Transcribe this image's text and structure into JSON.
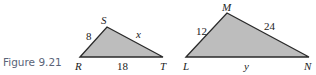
{
  "caption": "Figure 9.21",
  "colors": {
    "fill": "#bdbdbd",
    "stroke": "#2a2a2a",
    "caption": "#5a6478"
  },
  "triangle1": {
    "vertices": {
      "R": "R",
      "S": "S",
      "T": "T"
    },
    "sides": {
      "RS": "8",
      "ST": "x",
      "RT": "18"
    }
  },
  "triangle2": {
    "vertices": {
      "L": "L",
      "M": "M",
      "N": "N"
    },
    "sides": {
      "LM": "12",
      "MN": "24",
      "LN": "y"
    }
  }
}
